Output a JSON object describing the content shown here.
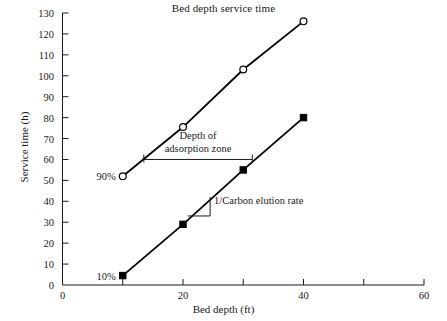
{
  "chart_data": {
    "type": "line",
    "title": "Bed depth service time",
    "xlabel": "Bed depth (ft)",
    "ylabel": "Service time (h)",
    "xlim": [
      0,
      60
    ],
    "ylim": [
      0,
      130
    ],
    "grid": false,
    "legend": "none",
    "xticks": [
      0,
      10,
      20,
      30,
      40,
      50,
      60
    ],
    "xticklabels": [
      "0",
      "",
      "20",
      "",
      "40",
      "",
      "60"
    ],
    "yticks": [
      0,
      10,
      20,
      30,
      40,
      50,
      60,
      70,
      80,
      90,
      100,
      110,
      120,
      130
    ],
    "yticklabels": [
      "0",
      "10",
      "20",
      "30",
      "40",
      "50",
      "60",
      "70",
      "80",
      "90",
      "100",
      "110",
      "120",
      "130"
    ],
    "series": [
      {
        "name": "90%",
        "marker": "open-circle",
        "color": "#000000",
        "x": [
          10,
          20,
          30,
          40
        ],
        "values": [
          52,
          75.5,
          103,
          126
        ]
      },
      {
        "name": "10%",
        "marker": "filled-square",
        "color": "#000000",
        "x": [
          10,
          20,
          30,
          40
        ],
        "values": [
          4.5,
          29,
          55,
          80
        ]
      }
    ],
    "point_labels": [
      {
        "text": "90%",
        "x": 10,
        "y": 52
      },
      {
        "text": "10%",
        "x": 10,
        "y": 4.5
      }
    ],
    "annotations": [
      {
        "id": "depth-of-adsorption-zone",
        "line1": "Depth of",
        "line2": "adsorption zone",
        "text": "Depth of adsorption zone",
        "marker": "horizontal-bracket",
        "bracket_x_start": 13.5,
        "bracket_x_end": 31.5,
        "bracket_y": 60
      },
      {
        "id": "carbon-elution-rate",
        "line1": "1/Carbon elution rate",
        "line2": "",
        "text": "1/Carbon elution rate",
        "marker": "slope-triangle",
        "slope_x_start": 20.8,
        "slope_x_end": 24.5,
        "slope_y_low": 33,
        "slope_y_high": 42
      }
    ]
  },
  "axes": {
    "title": "Bed depth service time",
    "xlabel": "Bed depth (ft)",
    "ylabel": "Service time (h)"
  }
}
